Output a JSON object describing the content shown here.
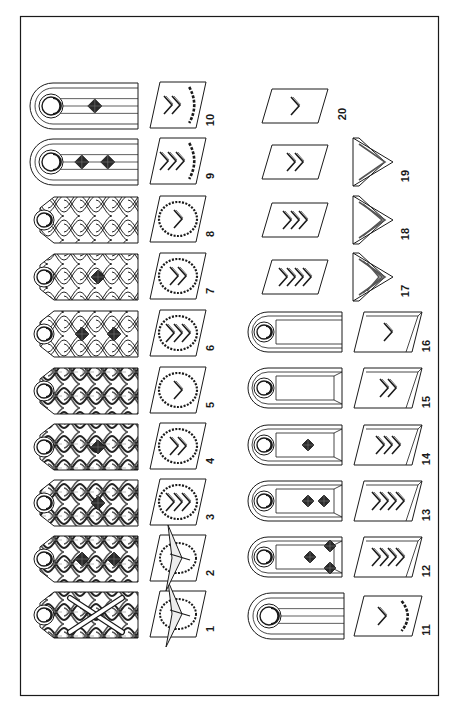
{
  "figure": {
    "orientation": "rotated 90 degrees (read with right side up)",
    "frame": {
      "x": 20,
      "y": 16,
      "w": 418,
      "h": 679
    },
    "ink_color": "#1a1a1a",
    "paper_color": "#ffffff"
  },
  "items": [
    {
      "id": 1,
      "label": "1",
      "type": "braided-board",
      "braid": "heavy",
      "pips": 0,
      "batons": true,
      "patch": {
        "type": "eagle-wreath"
      }
    },
    {
      "id": 2,
      "label": "2",
      "type": "braided-board",
      "braid": "heavy",
      "pips": 2,
      "batons": false,
      "patch": {
        "type": "eagle-wreath"
      }
    },
    {
      "id": 3,
      "label": "3",
      "type": "braided-board",
      "braid": "heavy",
      "pips": 1,
      "batons": false,
      "patch": {
        "type": "wreath",
        "chevrons": 3
      }
    },
    {
      "id": 4,
      "label": "4",
      "type": "braided-board",
      "braid": "heavy",
      "pips": 1,
      "batons": false,
      "patch": {
        "type": "wreath",
        "chevrons": 2
      }
    },
    {
      "id": 5,
      "label": "5",
      "type": "braided-board",
      "braid": "heavy",
      "pips": 0,
      "batons": false,
      "patch": {
        "type": "wreath",
        "chevrons": 1
      }
    },
    {
      "id": 6,
      "label": "6",
      "type": "braided-board",
      "braid": "light",
      "pips": 2,
      "batons": false,
      "patch": {
        "type": "wreath",
        "chevrons": 3
      }
    },
    {
      "id": 7,
      "label": "7",
      "type": "braided-board",
      "braid": "light",
      "pips": 1,
      "batons": false,
      "patch": {
        "type": "wreath",
        "chevrons": 2
      }
    },
    {
      "id": 8,
      "label": "8",
      "type": "braided-board",
      "braid": "light",
      "pips": 0,
      "batons": false,
      "patch": {
        "type": "wreath",
        "chevrons": 1
      }
    },
    {
      "id": 9,
      "label": "9",
      "type": "striped-board",
      "pips": 2,
      "patch": {
        "type": "half-wreath",
        "chevrons": 3
      }
    },
    {
      "id": 10,
      "label": "10",
      "type": "striped-board",
      "pips": 1,
      "patch": {
        "type": "half-wreath",
        "chevrons": 2
      }
    },
    {
      "id": 11,
      "label": "11",
      "type": "striped-board",
      "pips": 0,
      "patch": {
        "type": "half-wreath",
        "chevrons": 1
      }
    },
    {
      "id": 12,
      "label": "12",
      "type": "bordered-board",
      "pips": 3,
      "patch": {
        "type": "bordered",
        "chevrons": 4
      }
    },
    {
      "id": 13,
      "label": "13",
      "type": "bordered-board",
      "pips": 2,
      "patch": {
        "type": "bordered",
        "chevrons": 4
      }
    },
    {
      "id": 14,
      "label": "14",
      "type": "bordered-board",
      "pips": 1,
      "patch": {
        "type": "bordered",
        "chevrons": 3
      }
    },
    {
      "id": 15,
      "label": "15",
      "type": "bordered-board",
      "pips": 0,
      "patch": {
        "type": "bordered",
        "chevrons": 2
      }
    },
    {
      "id": 16,
      "label": "16",
      "type": "plain-board",
      "pips": 0,
      "patch": {
        "type": "bordered",
        "chevrons": 1
      }
    },
    {
      "id": 17,
      "label": "17",
      "type": "sleeve-chevron",
      "stripes": 3,
      "patch": {
        "type": "plain",
        "chevrons": 4
      }
    },
    {
      "id": 18,
      "label": "18",
      "type": "sleeve-chevron",
      "stripes": 2,
      "patch": {
        "type": "plain",
        "chevrons": 3
      }
    },
    {
      "id": 19,
      "label": "19",
      "type": "sleeve-chevron",
      "stripes": 1,
      "patch": {
        "type": "plain",
        "chevrons": 2
      }
    },
    {
      "id": 20,
      "label": "20",
      "type": "none",
      "patch": {
        "type": "plain",
        "chevrons": 1
      }
    }
  ]
}
